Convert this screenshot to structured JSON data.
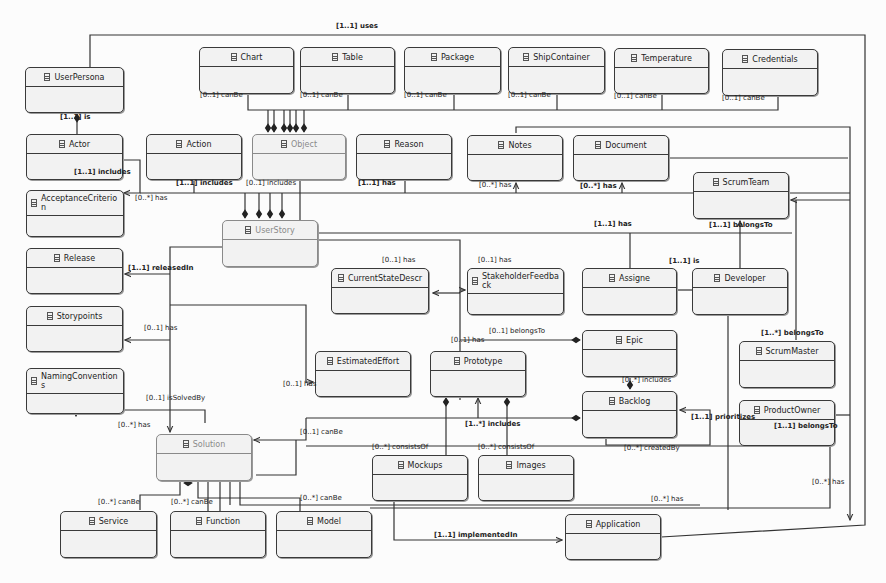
{
  "diagram": {
    "classes": [
      {
        "id": "userpersona",
        "name": "UserPersona",
        "x": 25,
        "y": 67,
        "w": 99,
        "h": 46
      },
      {
        "id": "chart",
        "name": "Chart",
        "x": 199,
        "y": 47,
        "w": 95,
        "h": 47
      },
      {
        "id": "table",
        "name": "Table",
        "x": 300,
        "y": 47,
        "w": 95,
        "h": 47
      },
      {
        "id": "package",
        "name": "Package",
        "x": 404,
        "y": 47,
        "w": 97,
        "h": 47
      },
      {
        "id": "shipcontainer",
        "name": "ShipContainer",
        "x": 508,
        "y": 47,
        "w": 97,
        "h": 47
      },
      {
        "id": "temperature",
        "name": "Temperature",
        "x": 614,
        "y": 48,
        "w": 95,
        "h": 46
      },
      {
        "id": "credentials",
        "name": "Credentials",
        "x": 722,
        "y": 49,
        "w": 96,
        "h": 47
      },
      {
        "id": "actor",
        "name": "Actor",
        "x": 26,
        "y": 134,
        "w": 97,
        "h": 46
      },
      {
        "id": "action",
        "name": "Action",
        "x": 146,
        "y": 134,
        "w": 96,
        "h": 46
      },
      {
        "id": "object",
        "name": "Object",
        "x": 252,
        "y": 134,
        "w": 94,
        "h": 46,
        "faded": true
      },
      {
        "id": "reason",
        "name": "Reason",
        "x": 356,
        "y": 134,
        "w": 96,
        "h": 46
      },
      {
        "id": "notes",
        "name": "Notes",
        "x": 467,
        "y": 135,
        "w": 96,
        "h": 46
      },
      {
        "id": "document",
        "name": "Document",
        "x": 573,
        "y": 135,
        "w": 96,
        "h": 46
      },
      {
        "id": "scrumteam",
        "name": "ScrumTeam",
        "x": 693,
        "y": 172,
        "w": 96,
        "h": 47
      },
      {
        "id": "acceptancecriterion",
        "name": "AcceptanceCriterion",
        "x": 26,
        "y": 190,
        "w": 98,
        "h": 47,
        "tall": true
      },
      {
        "id": "userstory",
        "name": "UserStory",
        "x": 222,
        "y": 220,
        "w": 96,
        "h": 47,
        "faded": true
      },
      {
        "id": "release",
        "name": "Release",
        "x": 26,
        "y": 248,
        "w": 97,
        "h": 46
      },
      {
        "id": "currentstatedescr",
        "name": "CurrentStateDescr",
        "x": 331,
        "y": 268,
        "w": 98,
        "h": 46
      },
      {
        "id": "stakeholderfeedback",
        "name": "StakeholderFeedback",
        "x": 467,
        "y": 268,
        "w": 97,
        "h": 47,
        "tall": true
      },
      {
        "id": "assigne",
        "name": "Assigne",
        "x": 582,
        "y": 268,
        "w": 95,
        "h": 47
      },
      {
        "id": "developer",
        "name": "Developer",
        "x": 692,
        "y": 268,
        "w": 96,
        "h": 47
      },
      {
        "id": "storypoints",
        "name": "Storypoints",
        "x": 26,
        "y": 306,
        "w": 97,
        "h": 46
      },
      {
        "id": "epic",
        "name": "Epic",
        "x": 582,
        "y": 330,
        "w": 95,
        "h": 47
      },
      {
        "id": "estimatedeffort",
        "name": "EstimatedEffort",
        "x": 315,
        "y": 351,
        "w": 96,
        "h": 46
      },
      {
        "id": "prototype",
        "name": "Prototype",
        "x": 430,
        "y": 351,
        "w": 96,
        "h": 46
      },
      {
        "id": "scrummaster",
        "name": "ScrumMaster",
        "x": 739,
        "y": 341,
        "w": 96,
        "h": 47
      },
      {
        "id": "namingconventions",
        "name": "NamingConventions",
        "x": 26,
        "y": 368,
        "w": 98,
        "h": 46,
        "tall": true
      },
      {
        "id": "backlog",
        "name": "Backlog",
        "x": 582,
        "y": 391,
        "w": 95,
        "h": 47
      },
      {
        "id": "productowner",
        "name": "ProductOwner",
        "x": 739,
        "y": 400,
        "w": 96,
        "h": 46
      },
      {
        "id": "solution",
        "name": "Solution",
        "x": 156,
        "y": 434,
        "w": 96,
        "h": 47,
        "faded": true
      },
      {
        "id": "mockups",
        "name": "Mockups",
        "x": 372,
        "y": 455,
        "w": 96,
        "h": 46
      },
      {
        "id": "images",
        "name": "Images",
        "x": 478,
        "y": 455,
        "w": 96,
        "h": 46
      },
      {
        "id": "service",
        "name": "Service",
        "x": 60,
        "y": 511,
        "w": 97,
        "h": 47
      },
      {
        "id": "function",
        "name": "Function",
        "x": 170,
        "y": 511,
        "w": 96,
        "h": 47
      },
      {
        "id": "model",
        "name": "Model",
        "x": 276,
        "y": 511,
        "w": 96,
        "h": 47
      },
      {
        "id": "application",
        "name": "Application",
        "x": 565,
        "y": 514,
        "w": 96,
        "h": 46
      }
    ],
    "labels": [
      {
        "text": "[1..1] uses",
        "x": 336,
        "y": 28,
        "bold": true
      },
      {
        "text": "[0..1] canBe",
        "x": 200,
        "y": 97
      },
      {
        "text": "[0..1] canBe",
        "x": 300,
        "y": 97
      },
      {
        "text": "[0..1] canBe",
        "x": 404,
        "y": 97
      },
      {
        "text": "[0..1] canBe",
        "x": 508,
        "y": 97
      },
      {
        "text": "[0..1] canBe",
        "x": 614,
        "y": 98
      },
      {
        "text": "[0..1] canBe",
        "x": 722,
        "y": 100
      },
      {
        "text": "[1..1] is",
        "x": 60,
        "y": 119,
        "bold": true
      },
      {
        "text": "[1..1] includes",
        "x": 74,
        "y": 174,
        "bold": true
      },
      {
        "text": "[1..1] includes",
        "x": 176,
        "y": 185,
        "bold": true
      },
      {
        "text": "[0..1] includes",
        "x": 246,
        "y": 185
      },
      {
        "text": "[1..1] has",
        "x": 358,
        "y": 185,
        "bold": true
      },
      {
        "text": "[0..*] has",
        "x": 479,
        "y": 187
      },
      {
        "text": "[0..*] has",
        "x": 580,
        "y": 188,
        "bold": true
      },
      {
        "text": "[0..*] has",
        "x": 135,
        "y": 200
      },
      {
        "text": "[1..1] has",
        "x": 594,
        "y": 226,
        "bold": true
      },
      {
        "text": "[1..1] belongsTo",
        "x": 709,
        "y": 227,
        "bold": true
      },
      {
        "text": "[1..1] is",
        "x": 669,
        "y": 263,
        "bold": true
      },
      {
        "text": "[1..1] releasedIn",
        "x": 128,
        "y": 270,
        "bold": true
      },
      {
        "text": "[0..1] has",
        "x": 382,
        "y": 262
      },
      {
        "text": "[0..1] has",
        "x": 478,
        "y": 262
      },
      {
        "text": "[0..1] has",
        "x": 144,
        "y": 330
      },
      {
        "text": "[0..1] belongsTo",
        "x": 489,
        "y": 333
      },
      {
        "text": "[0..1] has",
        "x": 451,
        "y": 342
      },
      {
        "text": "[1..*] belongsTo",
        "x": 761,
        "y": 335,
        "bold": true
      },
      {
        "text": "[0..*] includes",
        "x": 622,
        "y": 382
      },
      {
        "text": "[0..1] has",
        "x": 283,
        "y": 386
      },
      {
        "text": "[0..1] isSolvedBy",
        "x": 146,
        "y": 400
      },
      {
        "text": "[0..*] has",
        "x": 118,
        "y": 427
      },
      {
        "text": "[1..1] prioritizes",
        "x": 691,
        "y": 419,
        "bold": true
      },
      {
        "text": "[1..1] belongsTo",
        "x": 774,
        "y": 428,
        "bold": true
      },
      {
        "text": "[1..*] includes",
        "x": 465,
        "y": 426,
        "bold": true
      },
      {
        "text": "[0..1] canBe",
        "x": 300,
        "y": 434
      },
      {
        "text": "[0..*] createdBy",
        "x": 624,
        "y": 450
      },
      {
        "text": "[0..*] consistsOf",
        "x": 372,
        "y": 449
      },
      {
        "text": "[0..*] consistsOf",
        "x": 478,
        "y": 449
      },
      {
        "text": "[0..*] has",
        "x": 812,
        "y": 484
      },
      {
        "text": "[0..*] has",
        "x": 651,
        "y": 501
      },
      {
        "text": "[0..*] canBe",
        "x": 98,
        "y": 504
      },
      {
        "text": "[0..*] canBe",
        "x": 171,
        "y": 504
      },
      {
        "text": "[0..*] canBe",
        "x": 300,
        "y": 500
      },
      {
        "text": "[1..1] implementedIn",
        "x": 434,
        "y": 537,
        "bold": true
      }
    ]
  }
}
